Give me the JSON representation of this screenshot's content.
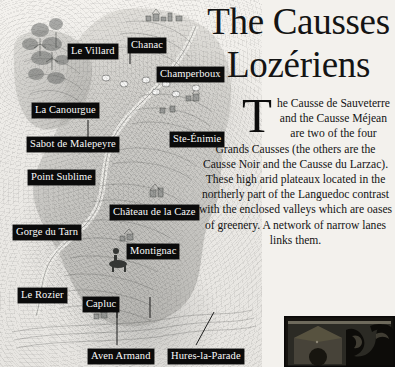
{
  "page": {
    "background_color": "#f2f0ec",
    "text_color": "#141414"
  },
  "article": {
    "title_line1": "The Causses",
    "title_line2": "Lozériens",
    "dropcap": "T",
    "paragraph_1": "he Causse de Sauveterre and the Causse Méjean are two of the four Grands Causses (the others are the  Causse Noir and the Causse du Larzac).",
    "paragraph_2": "These high arid plateaux located in the northerly part of the Languedoc contrast with the enclosed valleys which are oases of greenery. A network of narrow lanes links them."
  },
  "map": {
    "style": "illustrated grayscale engraving",
    "label_background": "#0b0b0b",
    "label_color": "#fafafa",
    "labels": [
      {
        "name": "le-villard",
        "text": "Le Villard",
        "x": 68,
        "y": 44
      },
      {
        "name": "chanac",
        "text": "Chanac",
        "x": 128,
        "y": 38
      },
      {
        "name": "champerboux",
        "text": "Champerboux",
        "x": 157,
        "y": 67
      },
      {
        "name": "la-canourgue",
        "text": "La Canourgue",
        "x": 32,
        "y": 103
      },
      {
        "name": "sabot-de-malepeyre",
        "text": "Sabot de Malepeyre",
        "x": 27,
        "y": 137
      },
      {
        "name": "ste-enimie",
        "text": "Ste-Énimie",
        "x": 170,
        "y": 132
      },
      {
        "name": "point-sublime",
        "text": "Point Sublime",
        "x": 28,
        "y": 170
      },
      {
        "name": "chateau-de-la-caze",
        "text": "Château de la Caze",
        "x": 110,
        "y": 205
      },
      {
        "name": "gorge-du-tarn",
        "text": "Gorge du Tarn",
        "x": 13,
        "y": 225
      },
      {
        "name": "montignac",
        "text": "Montignac",
        "x": 127,
        "y": 244
      },
      {
        "name": "le-rozier",
        "text": "Le Rozier",
        "x": 18,
        "y": 288
      },
      {
        "name": "capluc",
        "text": "Capluc",
        "x": 83,
        "y": 297
      },
      {
        "name": "aven-armand",
        "text": "Aven Armand",
        "x": 88,
        "y": 349
      },
      {
        "name": "hures-la-parade",
        "text": "Hures-la-Parade",
        "x": 168,
        "y": 349
      }
    ]
  },
  "photo": {
    "caption": "",
    "description": "dark framed photograph of stone building and ironwork"
  }
}
